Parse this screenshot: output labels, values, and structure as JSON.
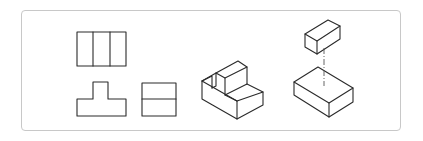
{
  "figure": {
    "colors": {
      "line": "#2a2a2a",
      "frame": "#c8c8c8",
      "background": "#ffffff"
    },
    "frame": {
      "x": 21,
      "y": 10,
      "width": 380,
      "height": 121,
      "radius": 4
    },
    "orthographic_views": {
      "front_view": {
        "polylines": [
          [
            [
              77,
              32
            ],
            [
              126,
              32
            ],
            [
              126,
              66
            ],
            [
              77,
              66
            ],
            [
              77,
              32
            ]
          ],
          [
            [
              93,
              32
            ],
            [
              93,
              66
            ]
          ],
          [
            [
              110,
              32
            ],
            [
              110,
              66
            ]
          ]
        ]
      },
      "t_view": {
        "polylines": [
          [
            [
              93,
              82
            ],
            [
              108,
              82
            ],
            [
              108,
              99
            ],
            [
              126,
              99
            ],
            [
              126,
              116
            ],
            [
              77,
              116
            ],
            [
              77,
              99
            ],
            [
              93,
              99
            ],
            [
              93,
              82
            ]
          ]
        ]
      },
      "side_view": {
        "polylines": [
          [
            [
              142,
              83
            ],
            [
              176,
              83
            ],
            [
              176,
              116
            ],
            [
              142,
              116
            ],
            [
              142,
              83
            ]
          ],
          [
            [
              142,
              99
            ],
            [
              176,
              99
            ]
          ]
        ]
      }
    },
    "isometric_stepped_block": {
      "polylines": [
        [
          [
            202,
            81
          ],
          [
            216,
            73
          ],
          [
            238,
            61
          ],
          [
            247,
            67
          ],
          [
            247,
            84
          ],
          [
            263,
            92
          ],
          [
            263,
            105
          ],
          [
            237,
            119
          ],
          [
            202,
            99
          ],
          [
            202,
            81
          ]
        ],
        [
          [
            202,
            81
          ],
          [
            237,
            101
          ],
          [
            263,
            92
          ]
        ],
        [
          [
            237,
            101
          ],
          [
            237,
            119
          ]
        ],
        [
          [
            216,
            73
          ],
          [
            225,
            78
          ],
          [
            247,
            67
          ]
        ],
        [
          [
            225,
            78
          ],
          [
            225,
            95
          ],
          [
            237,
            101
          ]
        ],
        [
          [
            225,
            95
          ],
          [
            247,
            84
          ]
        ],
        [
          [
            202,
            81
          ],
          [
            212,
            76
          ],
          [
            212,
            88
          ]
        ],
        [
          [
            212,
            88
          ],
          [
            216,
            86
          ],
          [
            216,
            73
          ]
        ]
      ]
    },
    "isometric_exploded": {
      "small_box": {
        "polylines": [
          [
            [
              305,
              34
            ],
            [
              328,
              20
            ],
            [
              340,
              26
            ],
            [
              317,
              41
            ],
            [
              305,
              34
            ]
          ],
          [
            [
              305,
              34
            ],
            [
              305,
              47
            ],
            [
              317,
              54
            ],
            [
              340,
              39
            ],
            [
              340,
              26
            ]
          ],
          [
            [
              317,
              41
            ],
            [
              317,
              54
            ]
          ]
        ]
      },
      "large_box": {
        "polylines": [
          [
            [
              294,
              82
            ],
            [
              318,
              67
            ],
            [
              353,
              88
            ],
            [
              329,
              103
            ],
            [
              294,
              82
            ]
          ],
          [
            [
              294,
              82
            ],
            [
              294,
              95
            ],
            [
              329,
              117
            ],
            [
              353,
              102
            ],
            [
              353,
              88
            ]
          ],
          [
            [
              329,
              103
            ],
            [
              329,
              117
            ]
          ]
        ]
      },
      "center_line": {
        "x1": 324,
        "y1": 48,
        "x2": 324,
        "y2": 86
      }
    }
  }
}
